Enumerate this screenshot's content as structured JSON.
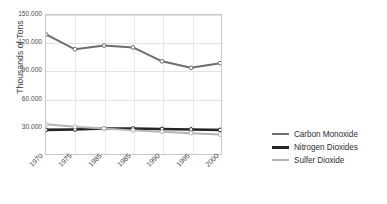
{
  "chart_data": {
    "type": "line",
    "title": "",
    "xlabel": "",
    "ylabel": "Thousands of Tons",
    "x": [
      "1970",
      "1975",
      "1985",
      "1985",
      "1990",
      "1995",
      "2000"
    ],
    "categories": [
      "1970",
      "1975",
      "1985",
      "1985",
      "1990",
      "1995",
      "2000"
    ],
    "xtick_labels": [
      "1970",
      "1975",
      "1985",
      "1985",
      "1990",
      "1995",
      "2000"
    ],
    "ytick_labels": [
      "150.000",
      "120.000",
      "90.000",
      "60.000",
      "30.000"
    ],
    "ytick_values": [
      150000,
      120000,
      90000,
      60000,
      30000
    ],
    "ylim": [
      0,
      150000
    ],
    "grid": true,
    "legend_position": "right",
    "series": [
      {
        "name": "Carbon Monoxide",
        "color": "#6e6e6e",
        "values": [
          129000,
          113000,
          117000,
          115000,
          100000,
          93000,
          98000
        ]
      },
      {
        "name": "Nitrogen Dioxides",
        "color": "#262626",
        "values": [
          26000,
          26500,
          27500,
          27500,
          27000,
          26500,
          26000
        ]
      },
      {
        "name": "Sulfer Dioxide",
        "color": "#b4b4b4",
        "values": [
          32000,
          29500,
          27500,
          25500,
          24000,
          22500,
          21000
        ]
      }
    ]
  },
  "legend": {
    "items": [
      {
        "label": "Carbon Monoxide",
        "color": "#6e6e6e",
        "thickness": "2px"
      },
      {
        "label": "Nitrogen Dioxides",
        "color": "#262626",
        "thickness": "3px"
      },
      {
        "label": "Sulfer Dioxide",
        "color": "#b4b4b4",
        "thickness": "2px"
      }
    ]
  }
}
